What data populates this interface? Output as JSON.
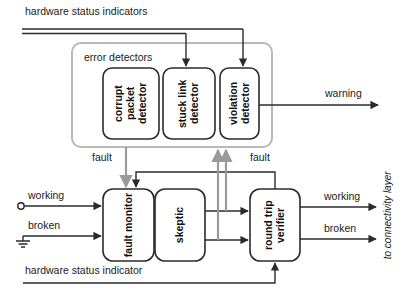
{
  "diagram": {
    "colors": {
      "stroke_black": "#2b2b2b",
      "stroke_gray": "#9a9a9a",
      "group_border": "#b9b9b9",
      "text": "#1a1a1a",
      "background": "#ffffff"
    },
    "groups": [
      {
        "id": "error-detectors-group",
        "label": "error detectors",
        "x": 72,
        "y": 43,
        "width": 200,
        "height": 104
      }
    ],
    "blocks": [
      {
        "id": "corrupt-packet-detector",
        "label": "corrupt packet detector",
        "lines": [
          "corrupt",
          "packet",
          "detector"
        ],
        "x": 103,
        "y": 68,
        "width": 56,
        "height": 71
      },
      {
        "id": "stuck-link-detector",
        "label": "stuck link detector",
        "lines": [
          "stuck",
          "link",
          "detector"
        ],
        "x": 163,
        "y": 68,
        "width": 52,
        "height": 71
      },
      {
        "id": "violation-detector",
        "label": "violation detector",
        "lines": [
          "violation",
          "detector"
        ],
        "x": 220,
        "y": 68,
        "width": 39,
        "height": 71
      },
      {
        "id": "fault-monitor",
        "label": "fault monitor",
        "lines": [
          "fault",
          "monitor"
        ],
        "x": 103,
        "y": 189,
        "width": 51,
        "height": 72
      },
      {
        "id": "skeptic",
        "label": "skeptic",
        "lines": [
          "skeptic"
        ],
        "x": 155,
        "y": 189,
        "width": 50,
        "height": 72
      },
      {
        "id": "round-trip-verifier",
        "label": "round trip verifier",
        "lines": [
          "round",
          "trip",
          "verifier"
        ],
        "x": 250,
        "y": 189,
        "width": 50,
        "height": 72
      }
    ],
    "labels": {
      "hardware_status_indicators_top": "hardware status indicators",
      "hardware_status_indicator_bottom": "hardware status indicator",
      "error_detectors": "error detectors",
      "warning": "warning",
      "fault_left": "fault",
      "fault_right": "fault",
      "working_in": "working",
      "broken_in": "broken",
      "working_out": "working",
      "broken_out": "broken",
      "to_connectivity_layer": "to connectivity layer"
    },
    "terminals": [
      {
        "id": "working-input-terminal",
        "type": "open-circle",
        "x": 20,
        "y": 206
      },
      {
        "id": "broken-input-ground",
        "type": "ground",
        "x": 23,
        "y": 236
      }
    ],
    "signals": [
      {
        "name": "hardware-status-to-stuck-link",
        "style": "black"
      },
      {
        "name": "hardware-status-to-violation",
        "style": "black"
      },
      {
        "name": "violation-to-warning",
        "style": "black"
      },
      {
        "name": "detectors-fault-to-fault-monitor",
        "style": "gray"
      },
      {
        "name": "round-trip-fault-to-fault-monitor",
        "style": "black"
      },
      {
        "name": "working-in-to-fault-monitor",
        "style": "black"
      },
      {
        "name": "broken-in-to-fault-monitor",
        "style": "black"
      },
      {
        "name": "skeptic-working-to-verifier",
        "style": "black"
      },
      {
        "name": "skeptic-broken-to-verifier",
        "style": "black"
      },
      {
        "name": "verifier-working-out",
        "style": "black"
      },
      {
        "name": "verifier-broken-out",
        "style": "black"
      },
      {
        "name": "feedback-up-left",
        "style": "gray"
      },
      {
        "name": "feedback-up-right",
        "style": "gray"
      },
      {
        "name": "hardware-status-to-verifier",
        "style": "black"
      }
    ]
  }
}
